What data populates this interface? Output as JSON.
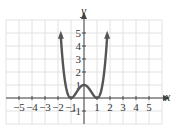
{
  "chart_data": {
    "type": "line",
    "title": "",
    "xlabel": "x",
    "ylabel": "y",
    "xlim": [
      -6,
      6
    ],
    "ylim": [
      -2,
      6
    ],
    "grid": true,
    "x_ticks": [
      "-5",
      "-4",
      "-3",
      "-2",
      "-1",
      "1",
      "2",
      "3",
      "4",
      "5"
    ],
    "y_ticks": [
      "-1",
      "1",
      "2",
      "3",
      "4",
      "5"
    ],
    "series": [
      {
        "name": "f(x) = (x^2 - 1)^2",
        "x": [
          -1.8,
          -1.6,
          -1.4,
          -1.2,
          -1.0,
          -0.8,
          -0.6,
          -0.4,
          -0.2,
          0,
          0.2,
          0.4,
          0.6,
          0.8,
          1.0,
          1.2,
          1.4,
          1.6,
          1.8
        ],
        "values": [
          5.02,
          2.43,
          0.92,
          0.19,
          0,
          0.13,
          0.41,
          0.71,
          0.92,
          1,
          0.92,
          0.71,
          0.41,
          0.13,
          0,
          0.19,
          0.92,
          2.43,
          5.02
        ],
        "color": "#555555",
        "end_arrows": true
      }
    ]
  },
  "labels": {
    "x": "x",
    "y": "y"
  }
}
